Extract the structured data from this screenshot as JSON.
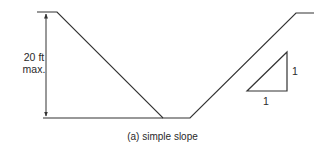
{
  "diagram": {
    "caption": "(a) simple slope",
    "dimension": {
      "value_line1": "20 ft",
      "value_line2": "max."
    },
    "slope_ratio": {
      "rise": "1",
      "run": "1"
    },
    "colors": {
      "line": "#333333",
      "background": "#ffffff"
    }
  }
}
